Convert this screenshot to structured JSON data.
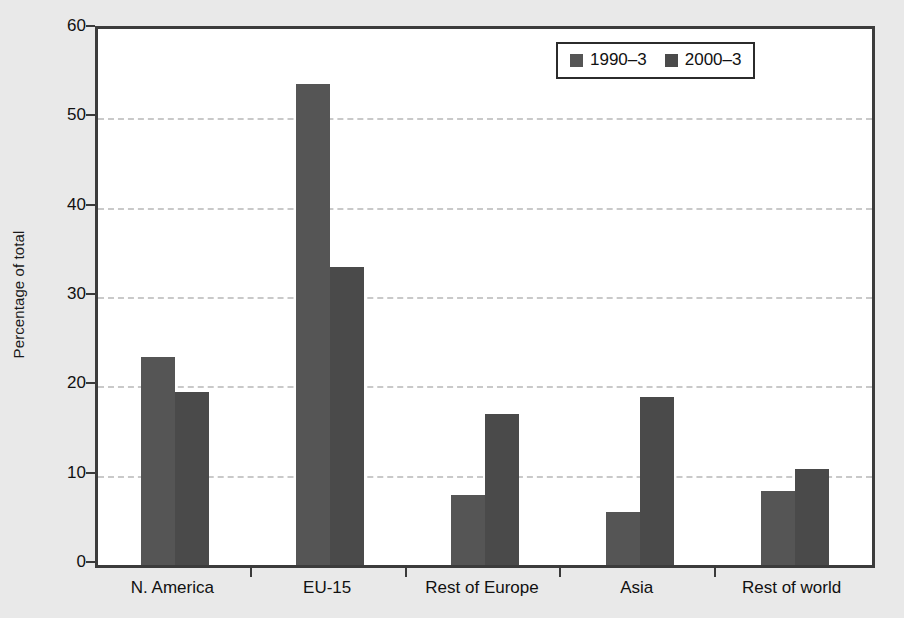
{
  "chart_data": {
    "type": "bar",
    "title": "",
    "subtitle": "",
    "xlabel": "",
    "ylabel": "Percentage of total",
    "categories": [
      "N. America",
      "EU-15",
      "Rest of Europe",
      "Asia",
      "Rest of world"
    ],
    "series": [
      {
        "name": "1990–3",
        "color": "#555555",
        "values": [
          23.3,
          53.9,
          7.8,
          5.9,
          8.3
        ]
      },
      {
        "name": "2000–3",
        "color": "#4a4a4a",
        "values": [
          19.4,
          33.4,
          16.9,
          18.8,
          10.8
        ]
      }
    ],
    "ylim": [
      0,
      60
    ],
    "yticks": [
      0,
      10,
      20,
      30,
      40,
      50,
      60
    ],
    "ytick_labels": [
      "0",
      "10",
      "20",
      "30",
      "40",
      "50",
      "60"
    ],
    "grid": "horizontal-dashed",
    "legend_position": "top-right-inside",
    "legend_entries": [
      "1990–3",
      "2000–3"
    ],
    "annotations": []
  },
  "colors": {
    "page_background": "#e9e9e9",
    "plot_background": "#ffffff",
    "axis": "#3c3c3c",
    "gridline": "#c9c9c9",
    "series_1": "#555555",
    "series_2": "#4a4a4a",
    "text": "#111111"
  }
}
